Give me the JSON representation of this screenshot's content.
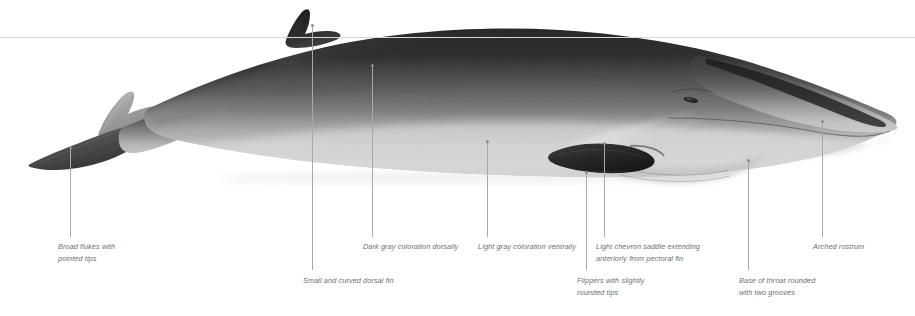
{
  "figure": {
    "background_color": "#ffffff",
    "reference_line": {
      "label": "waterline-rule",
      "color": "#d8d8d8",
      "y": 37
    },
    "leader_line_color": "#a8a8a8",
    "label_color": "#6e6e6e"
  },
  "callouts": [
    {
      "id": "broad-flukes",
      "text": "Broad flukes with\npointed tips",
      "label_x": 58,
      "label_y": 241,
      "line_x": 70,
      "line_top": 147,
      "line_height": 90
    },
    {
      "id": "dorsal-fin",
      "text": "Small and curved dorsal fin",
      "label_x": 303,
      "label_y": 275,
      "line_x": 312,
      "line_top": 25,
      "line_height": 245
    },
    {
      "id": "dark-gray-dorsal",
      "text": "Dark gray coloration dorsally",
      "label_x": 363,
      "label_y": 241,
      "line_x": 372,
      "line_top": 65,
      "line_height": 172
    },
    {
      "id": "light-gray-ventral",
      "text": "Light gray coloration ventrally",
      "label_x": 478,
      "label_y": 241,
      "line_x": 487,
      "line_top": 141,
      "line_height": 96
    },
    {
      "id": "flippers",
      "text": "Flippers with slightly\nrounded tips",
      "label_x": 577,
      "label_y": 275,
      "line_x": 586,
      "line_top": 172,
      "line_height": 98
    },
    {
      "id": "chevron-saddle",
      "text": "Light chevron saddle extending\nanteriorly from pectoral fin",
      "label_x": 596,
      "label_y": 241,
      "line_x": 604,
      "line_top": 143,
      "line_height": 94
    },
    {
      "id": "throat-grooves",
      "text": "Base of throat rounded\nwith two grooves",
      "label_x": 739,
      "label_y": 275,
      "line_x": 748,
      "line_top": 160,
      "line_height": 110
    },
    {
      "id": "arched-rostrum",
      "text": "Arched rostrum",
      "label_x": 813,
      "label_y": 241,
      "line_x": 822,
      "line_top": 121,
      "line_height": 116
    }
  ]
}
